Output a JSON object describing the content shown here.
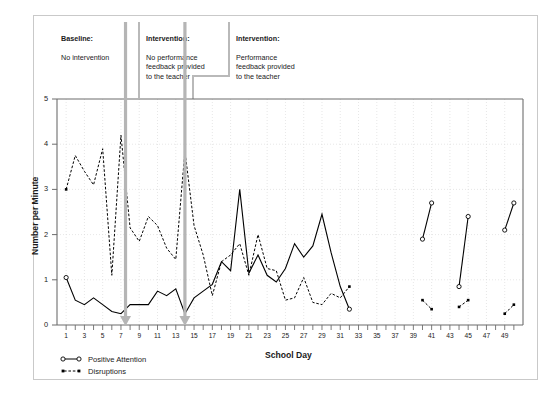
{
  "chart_data": {
    "type": "line",
    "title": "",
    "xlabel": "School Day",
    "ylabel": "Number per Minute",
    "xlim": [
      0,
      51
    ],
    "ylim": [
      0,
      5
    ],
    "yticks": [
      0,
      1,
      2,
      3,
      4,
      5
    ],
    "xticks": [
      1,
      3,
      5,
      7,
      9,
      11,
      13,
      15,
      17,
      19,
      21,
      23,
      25,
      27,
      29,
      31,
      33,
      35,
      37,
      39,
      41,
      43,
      45,
      47,
      49
    ],
    "grid": true,
    "legend_position": "below-left",
    "series": [
      {
        "name": "Positive Attention",
        "marker": "open-circle",
        "linestyle": "solid",
        "color": "#000000",
        "x": [
          1,
          2,
          3,
          4,
          5,
          6,
          7,
          8,
          9,
          10,
          11,
          12,
          13,
          14,
          15,
          16,
          17,
          18,
          19,
          20,
          21,
          22,
          23,
          24,
          25,
          26,
          27,
          28,
          29,
          30,
          31,
          32,
          40,
          41,
          44,
          45,
          49,
          50
        ],
        "y": [
          1.05,
          0.55,
          0.45,
          0.6,
          0.45,
          0.3,
          0.25,
          0.45,
          0.45,
          0.45,
          0.75,
          0.65,
          0.8,
          0.25,
          0.6,
          0.75,
          0.9,
          1.4,
          1.2,
          3.0,
          1.15,
          1.55,
          1.1,
          0.95,
          1.25,
          1.8,
          1.5,
          1.75,
          2.45,
          1.6,
          0.85,
          0.35,
          1.9,
          2.7,
          0.85,
          2.4,
          2.1,
          2.7
        ]
      },
      {
        "name": "Disruptions",
        "marker": "small-filled",
        "linestyle": "dashed",
        "color": "#000000",
        "x": [
          1,
          2,
          3,
          4,
          5,
          6,
          7,
          8,
          9,
          10,
          11,
          12,
          13,
          14,
          15,
          16,
          17,
          18,
          19,
          20,
          21,
          22,
          23,
          24,
          25,
          26,
          27,
          28,
          29,
          30,
          31,
          32,
          40,
          41,
          44,
          45,
          49,
          50
        ],
        "y": [
          3.0,
          3.75,
          3.4,
          3.1,
          3.9,
          1.1,
          4.2,
          2.15,
          1.85,
          2.4,
          2.2,
          1.7,
          1.45,
          3.85,
          2.2,
          1.55,
          0.65,
          1.4,
          1.55,
          1.8,
          1.1,
          2.0,
          1.25,
          1.2,
          0.55,
          0.6,
          1.05,
          0.5,
          0.45,
          0.7,
          0.6,
          0.85,
          0.55,
          0.35,
          0.4,
          0.55,
          0.25,
          0.45
        ]
      }
    ],
    "phases": [
      {
        "id": "baseline",
        "header": "Baseline:",
        "body": "No intervention",
        "boundary_day": null
      },
      {
        "id": "intervention-no-feedback",
        "header": "Intervention:",
        "body": "No performance\nfeedback provided\nto the teacher",
        "boundary_day": 7.5
      },
      {
        "id": "intervention-feedback",
        "header": "Intervention:",
        "body": "Performance\nfeedback provided\nto the teacher",
        "boundary_day": 14
      }
    ],
    "annotations": [
      {
        "name": "phase-arrow-1",
        "day": 7.5
      },
      {
        "name": "phase-arrow-2",
        "day": 14
      }
    ]
  },
  "legend": {
    "items": [
      {
        "label": "Positive Attention",
        "style": "solid-open-circle"
      },
      {
        "label": "Disruptions",
        "style": "dashed-filled-square"
      }
    ]
  },
  "axes": {
    "y_title": "Number per Minute",
    "x_title": "School Day",
    "ytick_labels": [
      "0",
      "1",
      "2",
      "3",
      "4",
      "5"
    ],
    "xtick_labels": [
      "1",
      "3",
      "5",
      "7",
      "9",
      "11",
      "13",
      "15",
      "17",
      "19",
      "21",
      "23",
      "25",
      "27",
      "29",
      "31",
      "33",
      "35",
      "37",
      "39",
      "41",
      "43",
      "45",
      "47",
      "49"
    ]
  },
  "colors": {
    "ink": "#000000",
    "frame": "#c9c9c9",
    "grid": "#dcdcdc",
    "phase_marker": "#b5b5b5",
    "axis": "#6d6d6d"
  },
  "caption": {
    "text": ""
  }
}
